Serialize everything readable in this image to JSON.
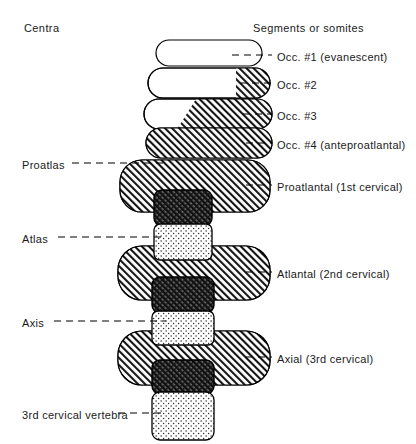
{
  "headers": {
    "left": "Centra",
    "right": "Segments or somites"
  },
  "right_labels": [
    {
      "id": "occ1",
      "text": "Occ. #1 (evanescent)",
      "x": 277,
      "y": 50,
      "leader": {
        "x1": 232,
        "x2": 272,
        "y": 55
      }
    },
    {
      "id": "occ2",
      "text": "Occ. #2",
      "x": 277,
      "y": 78,
      "leader": {
        "x1": 240,
        "x2": 272,
        "y": 83
      }
    },
    {
      "id": "occ3",
      "text": "Occ. #3",
      "x": 277,
      "y": 109,
      "leader": {
        "x1": 243,
        "x2": 272,
        "y": 114
      }
    },
    {
      "id": "occ4",
      "text": "Occ. #4 (anteproatlantal)",
      "x": 277,
      "y": 138,
      "leader": {
        "x1": 246,
        "x2": 272,
        "y": 143
      }
    },
    {
      "id": "proatlantal",
      "text": "Proatlantal (1st cervical)",
      "x": 277,
      "y": 180,
      "leader": {
        "x1": 246,
        "x2": 272,
        "y": 185
      }
    },
    {
      "id": "atlantal",
      "text": "Atlantal (2nd cervical)",
      "x": 277,
      "y": 267,
      "leader": {
        "x1": 246,
        "x2": 272,
        "y": 272
      }
    },
    {
      "id": "axial",
      "text": "Axial (3rd cervical)",
      "x": 277,
      "y": 352,
      "leader": {
        "x1": 246,
        "x2": 272,
        "y": 357
      }
    }
  ],
  "left_labels": [
    {
      "id": "proatlas",
      "text": "Proatlas",
      "x": 22,
      "y": 158,
      "leader": {
        "x1": 72,
        "x2": 166,
        "y": 163
      }
    },
    {
      "id": "atlas",
      "text": "Atlas",
      "x": 22,
      "y": 232,
      "leader": {
        "x1": 58,
        "x2": 166,
        "y": 237
      }
    },
    {
      "id": "axis",
      "text": "Axis",
      "x": 22,
      "y": 316,
      "leader": {
        "x1": 54,
        "x2": 166,
        "y": 321
      }
    },
    {
      "id": "third-cervical-vertebra",
      "text": "3rd cervical vertebra",
      "x": 22,
      "y": 408,
      "leader": {
        "x1": 118,
        "x2": 166,
        "y": 413
      },
      "twoline": true
    }
  ],
  "somites": [
    {
      "id": "occ1",
      "name": "occ-1-somite",
      "fill": "white",
      "x": 156,
      "y": 40,
      "w": 106,
      "h": 26,
      "r": 13
    },
    {
      "id": "occ2",
      "name": "occ-2-somite",
      "fill": "partial-hatch-small",
      "x": 148,
      "y": 68,
      "w": 122,
      "h": 30,
      "r": 15
    },
    {
      "id": "occ3",
      "name": "occ-3-somite",
      "fill": "partial-hatch-mid",
      "x": 144,
      "y": 99,
      "w": 128,
      "h": 30,
      "r": 15
    },
    {
      "id": "occ4",
      "name": "occ-4-somite",
      "fill": "hatch",
      "x": 146,
      "y": 128,
      "w": 126,
      "h": 30,
      "r": 15
    },
    {
      "id": "proatlantal",
      "name": "proatlantal-somite",
      "fill": "hatch",
      "x": 120,
      "y": 160,
      "w": 150,
      "h": 52,
      "r": 22
    },
    {
      "id": "atlantal",
      "name": "atlantal-somite",
      "fill": "hatch",
      "x": 118,
      "y": 246,
      "w": 152,
      "h": 54,
      "r": 24
    },
    {
      "id": "axial",
      "name": "axial-somite",
      "fill": "hatch",
      "x": 118,
      "y": 331,
      "w": 152,
      "h": 54,
      "r": 24
    }
  ],
  "arches": [
    {
      "id": "proatlas-arch",
      "name": "proatlas-neural-arch",
      "x": 154,
      "y": 190,
      "w": 58,
      "h": 36,
      "r": 8
    },
    {
      "id": "atlas-arch",
      "name": "atlas-neural-arch",
      "x": 152,
      "y": 277,
      "w": 62,
      "h": 36,
      "r": 8
    },
    {
      "id": "axis-arch",
      "name": "axis-neural-arch",
      "x": 152,
      "y": 360,
      "w": 62,
      "h": 34,
      "r": 8
    }
  ],
  "centra": [
    {
      "id": "atlas-centrum",
      "name": "atlas-centrum",
      "x": 154,
      "y": 224,
      "w": 58,
      "h": 36,
      "r": 6
    },
    {
      "id": "axis-centrum",
      "name": "axis-centrum",
      "x": 152,
      "y": 311,
      "w": 62,
      "h": 34,
      "r": 6
    },
    {
      "id": "third-centrum",
      "name": "third-cervical-centrum",
      "x": 152,
      "y": 392,
      "w": 62,
      "h": 48,
      "r": 8
    }
  ],
  "colors": {
    "ink": "#000000",
    "paper": "#ffffff",
    "hatch": "#1a1a1a",
    "dark_block": "#2b2b2b",
    "stipple": "#3a3a3a"
  }
}
